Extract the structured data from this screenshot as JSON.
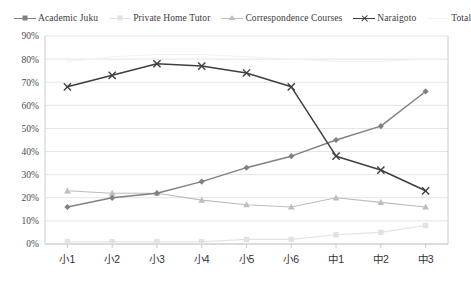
{
  "legend": {
    "position": "top",
    "items": [
      {
        "label": "Academic Juku",
        "marker": "diamond",
        "color": "#808080"
      },
      {
        "label": "Private Home Tutor",
        "marker": "square",
        "color": "#e2e2e2"
      },
      {
        "label": "Correspondence Courses",
        "marker": "triangle",
        "color": "#bdbdbd"
      },
      {
        "label": "Naraigoto",
        "marker": "x",
        "color": "#3f3f3f"
      },
      {
        "label": "Total",
        "marker": "line",
        "color": "#f2f2f2"
      }
    ]
  },
  "axis": {
    "y_ticks": [
      "90%",
      "80%",
      "70%",
      "60%",
      "50%",
      "40%",
      "30%",
      "20%",
      "10%",
      "0%"
    ],
    "x_ticks": [
      "小1",
      "小2",
      "小3",
      "小4",
      "小5",
      "小6",
      "中1",
      "中2",
      "中3"
    ]
  },
  "colors": {
    "grid": "#d9d9d9",
    "axis": "#bfbfbf",
    "background": "#ffffff",
    "text": "#3b3b3b"
  },
  "chart_data": {
    "type": "line",
    "title": "",
    "xlabel": "",
    "ylabel": "",
    "ylim": [
      0,
      90
    ],
    "ytick_step": 10,
    "ytick_format": "percent",
    "grid": true,
    "legend_position": "top",
    "categories": [
      "小1",
      "小2",
      "小3",
      "小4",
      "小5",
      "小6",
      "中1",
      "中2",
      "中3"
    ],
    "series": [
      {
        "name": "Academic Juku",
        "marker": "diamond",
        "color": "#808080",
        "values": [
          16,
          20,
          22,
          27,
          33,
          38,
          45,
          51,
          66
        ]
      },
      {
        "name": "Private Home Tutor",
        "marker": "square",
        "color": "#e2e2e2",
        "values": [
          1,
          1,
          1,
          1,
          2,
          2,
          4,
          5,
          8
        ]
      },
      {
        "name": "Correspondence Courses",
        "marker": "triangle",
        "color": "#bdbdbd",
        "values": [
          23,
          22,
          22,
          19,
          17,
          16,
          20,
          18,
          16
        ]
      },
      {
        "name": "Naraigoto",
        "marker": "x",
        "color": "#3f3f3f",
        "values": [
          68,
          73,
          78,
          77,
          74,
          68,
          38,
          32,
          23
        ]
      },
      {
        "name": "Total",
        "marker": "line",
        "color": "#f2f2f2",
        "values": [
          79,
          81,
          82,
          82,
          81,
          80,
          79,
          79,
          80
        ]
      }
    ]
  }
}
